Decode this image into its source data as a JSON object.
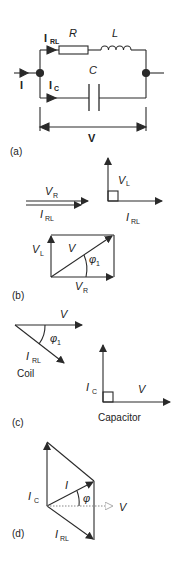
{
  "panels": {
    "a": {
      "tag": "(a)",
      "labels": {
        "current_in": "I",
        "branch_rl_main": "I",
        "branch_rl_sub": "RL",
        "branch_c_main": "I",
        "branch_c_sub": "C",
        "resistor": "R",
        "inductor": "L",
        "capacitor": "C",
        "voltage": "V"
      }
    },
    "b": {
      "tag": "(b)",
      "labels": {
        "vr_main": "V",
        "vr_sub": "R",
        "irl_main": "I",
        "irl_sub": "RL",
        "vl_main": "V",
        "vl_sub": "L",
        "irl2_main": "I",
        "irl2_sub": "RL",
        "rect_vl_main": "V",
        "rect_vl_sub": "L",
        "rect_v": "V",
        "rect_phi": "φ",
        "rect_phi_sub": "1",
        "rect_vr_main": "V",
        "rect_vr_sub": "R"
      }
    },
    "c": {
      "tag": "(c)",
      "labels": {
        "coil_v": "V",
        "coil_phi": "φ",
        "coil_phi_sub": "1",
        "coil_irl_main": "I",
        "coil_irl_sub": "RL",
        "coil_caption": "Coil",
        "cap_ic_main": "I",
        "cap_ic_sub": "C",
        "cap_v": "V",
        "cap_caption": "Capacitor"
      }
    },
    "d": {
      "tag": "(d)",
      "labels": {
        "ic_main": "I",
        "ic_sub": "C",
        "i": "I",
        "phi": "φ",
        "v": "V",
        "irl_main": "I",
        "irl_sub": "RL"
      }
    }
  },
  "colors": {
    "stroke": "#2a2a2a",
    "dotted": "#888888"
  }
}
